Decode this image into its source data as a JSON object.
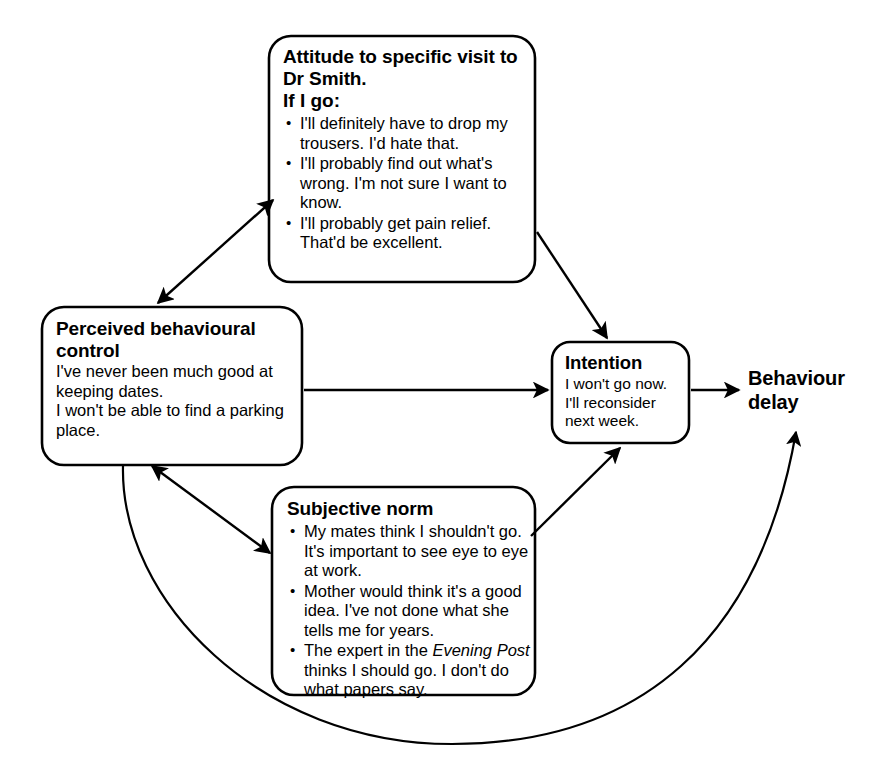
{
  "diagram": {
    "stroke_color": "#000000",
    "background_color": "#ffffff"
  },
  "nodes": {
    "attitude": {
      "title": "Attitude to specific visit to Dr Smith.",
      "subtitle": "If I go:",
      "bullets": [
        "I'll definitely have to drop my trousers. I'd hate that.",
        "I'll probably find out what's wrong. I'm not sure I want to know.",
        "I'll probably get pain relief. That'd be excellent."
      ]
    },
    "pbc": {
      "title": "Perceived behavioural control",
      "lines": [
        "I've never been much good at keeping dates.",
        "I won't be able to find a parking place."
      ]
    },
    "subjective": {
      "title": "Subjective norm",
      "bullets": [
        {
          "pre": "My mates think I shouldn't go. It's important to see eye to eye at work.",
          "em": "",
          "post": ""
        },
        {
          "pre": "Mother would think it's a good idea. I've not done what she tells me for years.",
          "em": "",
          "post": ""
        },
        {
          "pre": "The expert in the ",
          "em": "Evening Post",
          "post": " thinks I should go. I don't do what papers say."
        }
      ]
    },
    "intention": {
      "title": "Intention",
      "lines": [
        "I won't go now.",
        "I'll reconsider",
        "next week."
      ]
    },
    "outcome": {
      "title_line1": "Behaviour",
      "title_line2": "delay"
    }
  },
  "connections": [
    {
      "name": "attitude-pbc",
      "from": "attitude",
      "to": "pbc",
      "arrow": "double"
    },
    {
      "name": "attitude-intention",
      "from": "attitude",
      "to": "intention",
      "arrow": "single"
    },
    {
      "name": "pbc-intention",
      "from": "pbc",
      "to": "intention",
      "arrow": "single"
    },
    {
      "name": "pbc-subjective",
      "from": "pbc",
      "to": "subjective",
      "arrow": "double"
    },
    {
      "name": "subjective-intention",
      "from": "subjective",
      "to": "intention",
      "arrow": "single"
    },
    {
      "name": "intention-outcome",
      "from": "intention",
      "to": "outcome",
      "arrow": "single"
    },
    {
      "name": "pbc-outcome-feedback",
      "from": "pbc",
      "to": "outcome",
      "arrow": "single"
    }
  ]
}
